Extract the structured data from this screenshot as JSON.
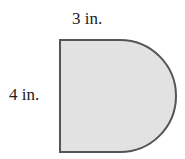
{
  "diagram": {
    "shape": "rectangle with semicircle on right side",
    "labels": {
      "top": "3 in.",
      "left": "4 in."
    },
    "dimensions": {
      "rectangle_width_in": 3,
      "height_in": 4
    },
    "colors": {
      "fill": "#e2e2e2",
      "stroke": "#555555"
    }
  }
}
